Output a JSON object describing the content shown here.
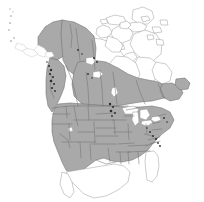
{
  "figure": {
    "type": "distribution-range-map",
    "title": "",
    "region": "North America",
    "background_color": "#ffffff",
    "width_px": 204,
    "height_px": 202
  },
  "legend": {
    "shaded_fill_color": "#a9a9a9",
    "shaded_meaning": "range present",
    "unshaded_fill_color": "#ffffff",
    "unshaded_meaning": "range absent",
    "boundary_line_color": "#6e6e6e",
    "marker_color": "#2e2e2e"
  },
  "map_regions": {
    "shaded": [
      "Alaska",
      "Yukon",
      "Northwest Territories (mainland south)",
      "British Columbia",
      "Alberta",
      "Saskatchewan",
      "Manitoba",
      "Ontario (south)",
      "Quebec (south)",
      "New Brunswick",
      "Nova Scotia",
      "Newfoundland",
      "Contiguous United States"
    ],
    "unshaded": [
      "Canadian Arctic Archipelago",
      "Baffin Island",
      "Victoria Island",
      "Banks Island",
      "Ellesmere Island",
      "Hudson Bay surrounds (north)",
      "Nunavut (north)",
      "Quebec (far north / Ungava)",
      "Florida",
      "Mexico",
      "Aleutian Islands"
    ],
    "water_bodies": [
      "Hudson Bay",
      "Great Lakes",
      "Great Salt Lake",
      "Great Slave Lake",
      "Great Bear Lake",
      "Lake Winnipeg"
    ]
  },
  "annotations": {
    "dark_markers_label": "occurrence points",
    "dark_marker_clusters": [
      "British Columbia coast",
      "Central prairies",
      "Appalachian corridor"
    ]
  }
}
